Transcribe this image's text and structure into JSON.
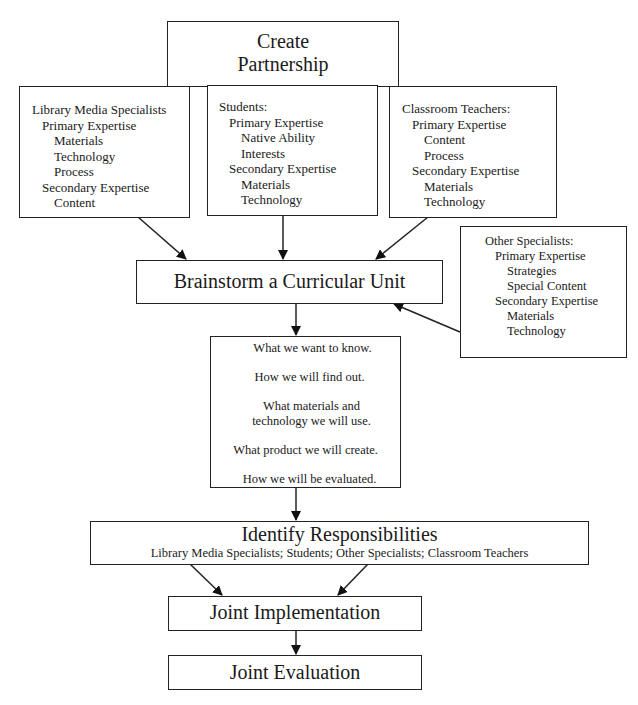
{
  "create_partnership": {
    "line1": "Create",
    "line2": "Partnership"
  },
  "library_media_specialists": {
    "title": "Library Media Specialists",
    "primary_label": "Primary Expertise",
    "primary": [
      "Materials",
      "Technology",
      "Process"
    ],
    "secondary_label": "Secondary Expertise",
    "secondary": [
      "Content"
    ]
  },
  "students": {
    "title": "Students:",
    "primary_label": "Primary Expertise",
    "primary": [
      "Native Ability",
      "Interests"
    ],
    "secondary_label": "Secondary Expertise",
    "secondary": [
      "Materials",
      "Technology"
    ]
  },
  "classroom_teachers": {
    "title": "Classroom Teachers:",
    "primary_label": "Primary Expertise",
    "primary": [
      "Content",
      "Process"
    ],
    "secondary_label": "Secondary Expertise",
    "secondary": [
      "Materials",
      "Technology"
    ]
  },
  "other_specialists": {
    "title": "Other Specialists:",
    "primary_label": "Primary Expertise",
    "primary": [
      "Strategies",
      "Special Content"
    ],
    "secondary_label": "Secondary Expertise",
    "secondary": [
      "Materials",
      "Technology"
    ]
  },
  "brainstorm": {
    "label": "Brainstorm a Curricular Unit"
  },
  "questions": [
    "What we want to know.",
    "How we will find out.",
    "What materials and",
    "technology we will use.",
    "What product we will create.",
    "How we will be evaluated."
  ],
  "identify": {
    "title": "Identify Responsibilities",
    "subtitle": "Library Media Specialists; Students; Other Specialists; Classroom Teachers"
  },
  "joint_implementation": {
    "label": "Joint Implementation"
  },
  "joint_evaluation": {
    "label": "Joint Evaluation"
  }
}
